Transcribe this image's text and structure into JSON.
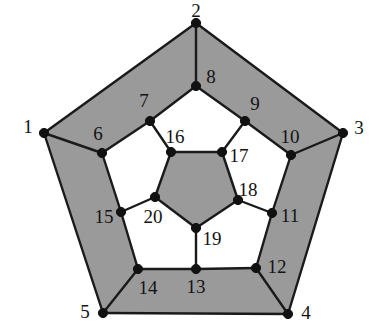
{
  "figure": {
    "name": "desargues-graph-drawing",
    "kind": "planar graph diagram",
    "width": 370,
    "height": 323,
    "background_color": "#ffffff",
    "edge_color": "#1a1a1a",
    "vertex_color": "#111111",
    "shaded_face_color": "#9a9a9a",
    "unshaded_face_color": "#ffffff"
  },
  "vertices": [
    {
      "label": "1",
      "x": 44,
      "y": 133,
      "label_x": 28,
      "label_y": 126
    },
    {
      "label": "2",
      "x": 196,
      "y": 23,
      "label_x": 196,
      "label_y": 10
    },
    {
      "label": "3",
      "x": 343,
      "y": 133,
      "label_x": 359,
      "label_y": 127
    },
    {
      "label": "4",
      "x": 288,
      "y": 314,
      "label_x": 306,
      "label_y": 312
    },
    {
      "label": "5",
      "x": 103,
      "y": 313,
      "label_x": 85,
      "label_y": 311
    },
    {
      "label": "6",
      "x": 102,
      "y": 153,
      "label_x": 98,
      "label_y": 133
    },
    {
      "label": "7",
      "x": 150,
      "y": 121,
      "label_x": 144,
      "label_y": 100
    },
    {
      "label": "8",
      "x": 196,
      "y": 86,
      "label_x": 211,
      "label_y": 76
    },
    {
      "label": "9",
      "x": 245,
      "y": 121,
      "label_x": 255,
      "label_y": 103
    },
    {
      "label": "10",
      "x": 291,
      "y": 155,
      "label_x": 290,
      "label_y": 136
    },
    {
      "label": "11",
      "x": 272,
      "y": 213,
      "label_x": 290,
      "label_y": 215
    },
    {
      "label": "12",
      "x": 256,
      "y": 268,
      "label_x": 277,
      "label_y": 266
    },
    {
      "label": "13",
      "x": 196,
      "y": 269,
      "label_x": 196,
      "label_y": 286
    },
    {
      "label": "14",
      "x": 138,
      "y": 269,
      "label_x": 148,
      "label_y": 287
    },
    {
      "label": "15",
      "x": 121,
      "y": 212,
      "label_x": 104,
      "label_y": 216
    },
    {
      "label": "16",
      "x": 171,
      "y": 152,
      "label_x": 175,
      "label_y": 136
    },
    {
      "label": "17",
      "x": 222,
      "y": 152,
      "label_x": 239,
      "label_y": 155
    },
    {
      "label": "18",
      "x": 238,
      "y": 200,
      "label_x": 248,
      "label_y": 189
    },
    {
      "label": "19",
      "x": 196,
      "y": 228,
      "label_x": 212,
      "label_y": 238
    },
    {
      "label": "20",
      "x": 155,
      "y": 197,
      "label_x": 153,
      "label_y": 216
    }
  ],
  "edges": [
    [
      "1",
      "2"
    ],
    [
      "2",
      "3"
    ],
    [
      "3",
      "4"
    ],
    [
      "4",
      "5"
    ],
    [
      "5",
      "1"
    ],
    [
      "1",
      "6"
    ],
    [
      "2",
      "8"
    ],
    [
      "3",
      "10"
    ],
    [
      "4",
      "12"
    ],
    [
      "5",
      "14"
    ],
    [
      "6",
      "7"
    ],
    [
      "7",
      "8"
    ],
    [
      "8",
      "9"
    ],
    [
      "9",
      "10"
    ],
    [
      "10",
      "11"
    ],
    [
      "11",
      "12"
    ],
    [
      "12",
      "13"
    ],
    [
      "13",
      "14"
    ],
    [
      "14",
      "15"
    ],
    [
      "15",
      "6"
    ],
    [
      "7",
      "16"
    ],
    [
      "9",
      "17"
    ],
    [
      "11",
      "18"
    ],
    [
      "13",
      "19"
    ],
    [
      "15",
      "20"
    ],
    [
      "16",
      "17"
    ],
    [
      "17",
      "18"
    ],
    [
      "18",
      "19"
    ],
    [
      "19",
      "20"
    ],
    [
      "20",
      "16"
    ]
  ],
  "faces": [
    {
      "name": "inner-pentagon",
      "shaded": true,
      "cycle": [
        "16",
        "17",
        "18",
        "19",
        "20"
      ]
    },
    {
      "name": "outer-wedge-top",
      "shaded": true,
      "cycle": [
        "2",
        "3",
        "10",
        "9",
        "8"
      ]
    },
    {
      "name": "outer-wedge-upper-left",
      "shaded": true,
      "cycle": [
        "1",
        "2",
        "8",
        "7",
        "6"
      ]
    },
    {
      "name": "outer-wedge-lower-left",
      "shaded": true,
      "cycle": [
        "1",
        "6",
        "15",
        "14",
        "5"
      ]
    },
    {
      "name": "outer-wedge-bottom",
      "shaded": true,
      "cycle": [
        "5",
        "14",
        "13",
        "12",
        "4"
      ]
    },
    {
      "name": "outer-wedge-right",
      "shaded": true,
      "cycle": [
        "3",
        "4",
        "12",
        "11",
        "10"
      ]
    },
    {
      "name": "mid-pentagon-upper-left",
      "shaded": false,
      "cycle": [
        "6",
        "7",
        "16",
        "20",
        "15"
      ]
    },
    {
      "name": "mid-pentagon-top",
      "shaded": false,
      "cycle": [
        "8",
        "9",
        "17",
        "16",
        "7"
      ]
    },
    {
      "name": "mid-pentagon-right",
      "shaded": false,
      "cycle": [
        "10",
        "11",
        "18",
        "17",
        "9"
      ]
    },
    {
      "name": "mid-pentagon-lower-right",
      "shaded": false,
      "cycle": [
        "12",
        "13",
        "19",
        "18",
        "11"
      ]
    },
    {
      "name": "mid-pentagon-lower-left",
      "shaded": false,
      "cycle": [
        "14",
        "15",
        "20",
        "19",
        "13"
      ]
    }
  ]
}
